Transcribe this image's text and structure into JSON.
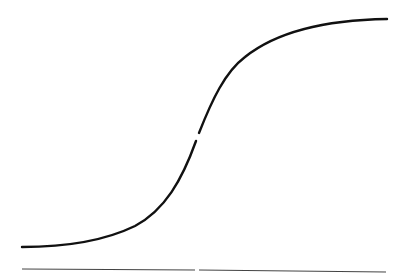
{
  "diagram": {
    "type": "sigmoid-curve",
    "colors": {
      "background": "#ffffff",
      "curve": "#111111",
      "baseline": "#444444"
    },
    "curve": {
      "start": [
        22,
        247
      ],
      "end": [
        387,
        19
      ],
      "gap_at": [
        198,
        137
      ]
    },
    "baseline": {
      "y": 270,
      "x_start": 22,
      "x_end": 386,
      "gap_at_x": 196
    }
  }
}
